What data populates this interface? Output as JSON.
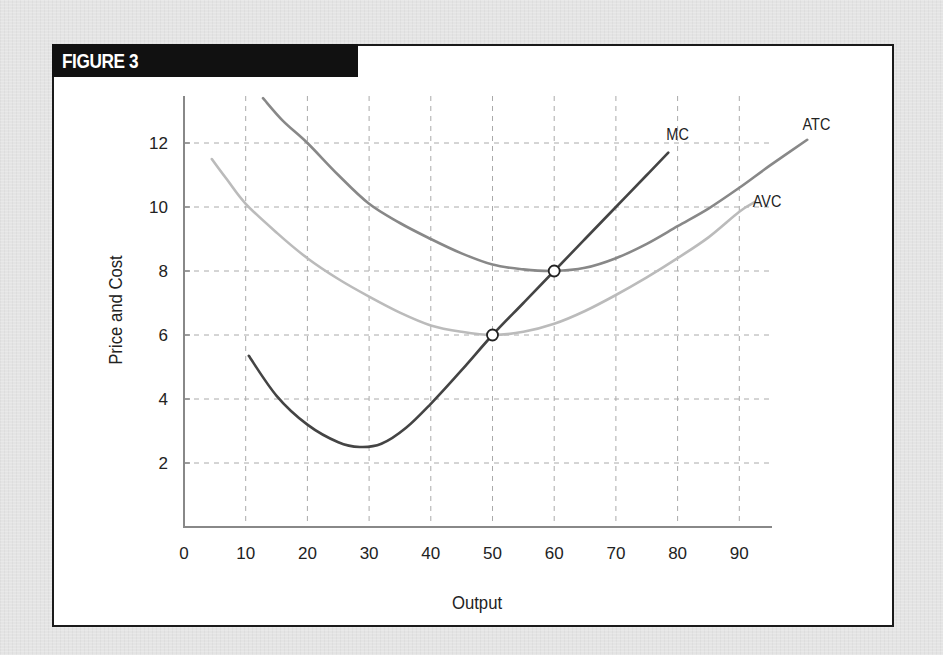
{
  "figure": {
    "header_label": "FIGURE 3",
    "colors": {
      "page_background": "#e4e4e4",
      "frame_border": "#1a1a1a",
      "header_background": "#111111",
      "axis": "#888888",
      "grid": "#aaaaaa"
    }
  },
  "chart_data": {
    "type": "line",
    "title": "FIGURE 3",
    "xlabel": "Output",
    "ylabel": "Price and Cost",
    "xlim": [
      0,
      95
    ],
    "ylim": [
      0,
      13.5
    ],
    "x_ticks": [
      0,
      10,
      20,
      30,
      40,
      50,
      60,
      70,
      80,
      90
    ],
    "y_ticks": [
      2,
      4,
      6,
      8,
      10,
      12
    ],
    "grid": true,
    "legend_position": "inline labels at curve ends",
    "series": [
      {
        "name": "MC",
        "color": "#444444",
        "points": [
          [
            10.5,
            5.35
          ],
          [
            15,
            4.1
          ],
          [
            20,
            3.2
          ],
          [
            25,
            2.65
          ],
          [
            28.5,
            2.5
          ],
          [
            32,
            2.6
          ],
          [
            36,
            3.1
          ],
          [
            40,
            3.85
          ],
          [
            45,
            4.9
          ],
          [
            50,
            6.0
          ],
          [
            55,
            7.0
          ],
          [
            60,
            8.0
          ],
          [
            65,
            9.0
          ],
          [
            70,
            10.0
          ],
          [
            75,
            11.0
          ],
          [
            78.5,
            11.7
          ]
        ]
      },
      {
        "name": "ATC",
        "color": "#888888",
        "points": [
          [
            12.8,
            13.4
          ],
          [
            16,
            12.7
          ],
          [
            20,
            12.0
          ],
          [
            25,
            11.0
          ],
          [
            30,
            10.1
          ],
          [
            35,
            9.5
          ],
          [
            40,
            9.0
          ],
          [
            45,
            8.55
          ],
          [
            50,
            8.2
          ],
          [
            55,
            8.05
          ],
          [
            60,
            8.0
          ],
          [
            65,
            8.1
          ],
          [
            70,
            8.4
          ],
          [
            75,
            8.85
          ],
          [
            80,
            9.4
          ],
          [
            85,
            9.95
          ],
          [
            90,
            10.6
          ],
          [
            95,
            11.3
          ],
          [
            101,
            12.1
          ]
        ]
      },
      {
        "name": "AVC",
        "color": "#bbbbbb",
        "points": [
          [
            4.5,
            11.5
          ],
          [
            7,
            10.85
          ],
          [
            10,
            10.1
          ],
          [
            15,
            9.2
          ],
          [
            20,
            8.4
          ],
          [
            25,
            7.75
          ],
          [
            30,
            7.2
          ],
          [
            35,
            6.7
          ],
          [
            40,
            6.3
          ],
          [
            45,
            6.1
          ],
          [
            50,
            6.0
          ],
          [
            55,
            6.1
          ],
          [
            60,
            6.35
          ],
          [
            65,
            6.75
          ],
          [
            70,
            7.25
          ],
          [
            75,
            7.8
          ],
          [
            80,
            8.4
          ],
          [
            85,
            9.05
          ],
          [
            90,
            9.85
          ],
          [
            92.5,
            10.15
          ]
        ]
      }
    ],
    "annotations": [
      {
        "type": "open-circle",
        "x": 50,
        "y": 6,
        "note": "MC crosses AVC minimum"
      },
      {
        "type": "open-circle",
        "x": 60,
        "y": 8,
        "note": "MC crosses ATC minimum"
      }
    ],
    "labels": [
      {
        "text": "MC",
        "x": 80,
        "y": 12.1
      },
      {
        "text": "ATC",
        "x": 102.5,
        "y": 12.4
      },
      {
        "text": "AVC",
        "x": 94.5,
        "y": 10.0
      }
    ]
  }
}
